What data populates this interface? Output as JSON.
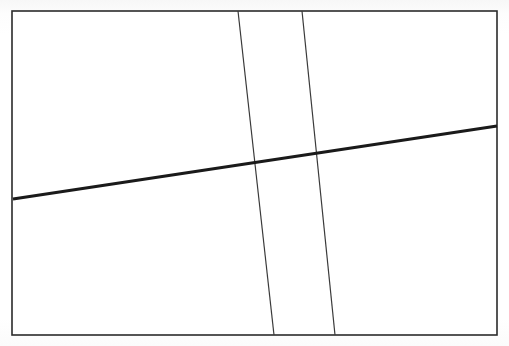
{
  "figure": {
    "kind": "line-drawing",
    "canvas": {
      "width": 509,
      "height": 346
    },
    "background_color": "#ffffff",
    "paper_tint_color": "#fdfdfd"
  },
  "frame": {
    "name": "bounding-rectangle",
    "x": 12,
    "y": 11,
    "width": 485,
    "height": 324,
    "stroke_color": "#2b2b2b",
    "stroke_width": 1.6,
    "fill_color": "#ffffff"
  },
  "lines": [
    {
      "id": "thick-diagonal",
      "label": "Thick diagonal line",
      "x1": 13,
      "y1": 199,
      "x2": 497,
      "y2": 126,
      "stroke_color": "#1a1a1a",
      "stroke_width": 3.1
    },
    {
      "id": "thin-vertical-left",
      "label": "Left thin near-vertical line",
      "x1": 238,
      "y1": 11,
      "x2": 274,
      "y2": 335,
      "stroke_color": "#3a3a3a",
      "stroke_width": 1.2
    },
    {
      "id": "thin-vertical-right",
      "label": "Right thin near-vertical line",
      "x1": 302,
      "y1": 11,
      "x2": 335,
      "y2": 335,
      "stroke_color": "#3a3a3a",
      "stroke_width": 1.2
    }
  ],
  "intersections": [
    {
      "id": "thick-crosses-left-thin",
      "x": 256,
      "y": 162
    },
    {
      "id": "thick-crosses-right-thin",
      "x": 319,
      "y": 152
    }
  ]
}
